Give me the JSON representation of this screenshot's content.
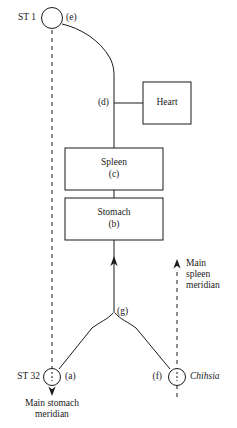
{
  "diagram": {
    "stroke_color": "#1a1a1a",
    "background_color": "#ffffff",
    "nodes": {
      "st1": {
        "point_label": "ST 1",
        "branch_label": "(e)"
      },
      "st32": {
        "point_label": "ST 32",
        "branch_label": "(a)"
      },
      "chihsia": {
        "point_label": "Chihsia",
        "branch_label": "(f)"
      },
      "junction_g": {
        "branch_label": "(g)"
      },
      "heart_connector": {
        "branch_label": "(d)"
      }
    },
    "boxes": [
      {
        "name": "heart",
        "label": "Heart",
        "sub_label": ""
      },
      {
        "name": "spleen",
        "label": "Spleen",
        "sub_label": "(c)"
      },
      {
        "name": "stomach",
        "label": "Stomach",
        "sub_label": "(b)"
      }
    ],
    "annotations": {
      "main_stomach_meridian": "Main stomach\nmeridian",
      "main_spleen_meridian": "Main\nspleen\nmeridian"
    }
  }
}
